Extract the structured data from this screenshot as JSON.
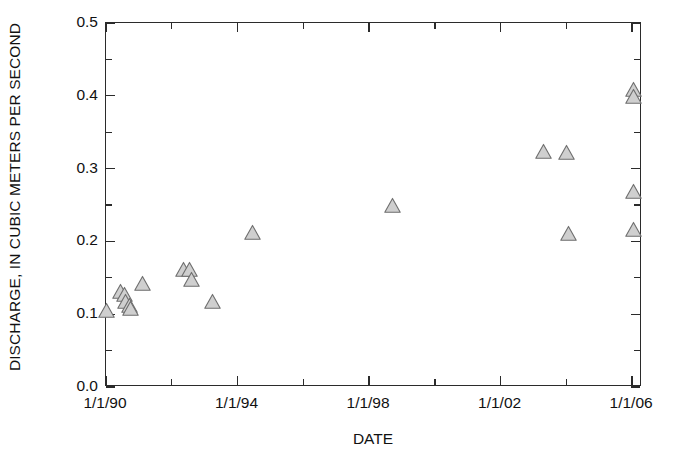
{
  "chart_data": {
    "type": "scatter",
    "title": "",
    "xlabel": "DATE",
    "ylabel": "DISCHARGE, IN CUBIC METERS PER SECOND",
    "xtick_labels": [
      "1/1/90",
      "1/1/94",
      "1/1/98",
      "1/1/02",
      "1/1/06"
    ],
    "xtick_values": [
      1990.0,
      1994.0,
      1998.0,
      2002.0,
      2006.0
    ],
    "xminor_values": [
      1992.0,
      1996.0,
      2000.0,
      2004.0
    ],
    "ytick_labels": [
      "0.0",
      "0.1",
      "0.2",
      "0.3",
      "0.4",
      "0.5"
    ],
    "ytick_values": [
      0.0,
      0.1,
      0.2,
      0.3,
      0.4,
      0.5
    ],
    "xlim": [
      1990.0,
      2006.3
    ],
    "ylim": [
      0.0,
      0.5
    ],
    "grid": false,
    "legend": null,
    "marker": {
      "shape": "triangle-up",
      "fill": "#cfcfcf",
      "stroke": "#6e6e6e",
      "size_px": 17
    },
    "points": [
      {
        "x": 1990.0,
        "y": 0.105
      },
      {
        "x": 1990.45,
        "y": 0.131
      },
      {
        "x": 1990.55,
        "y": 0.127
      },
      {
        "x": 1990.6,
        "y": 0.118
      },
      {
        "x": 1990.7,
        "y": 0.112
      },
      {
        "x": 1990.75,
        "y": 0.108
      },
      {
        "x": 1991.1,
        "y": 0.142
      },
      {
        "x": 1992.35,
        "y": 0.161
      },
      {
        "x": 1992.55,
        "y": 0.162
      },
      {
        "x": 1992.6,
        "y": 0.148
      },
      {
        "x": 1993.25,
        "y": 0.117
      },
      {
        "x": 1994.45,
        "y": 0.212
      },
      {
        "x": 1998.7,
        "y": 0.249
      },
      {
        "x": 2003.3,
        "y": 0.324
      },
      {
        "x": 2004.0,
        "y": 0.322
      },
      {
        "x": 2004.05,
        "y": 0.211
      },
      {
        "x": 2006.05,
        "y": 0.408
      },
      {
        "x": 2006.05,
        "y": 0.399
      },
      {
        "x": 2006.05,
        "y": 0.268
      },
      {
        "x": 2006.05,
        "y": 0.217
      }
    ]
  }
}
